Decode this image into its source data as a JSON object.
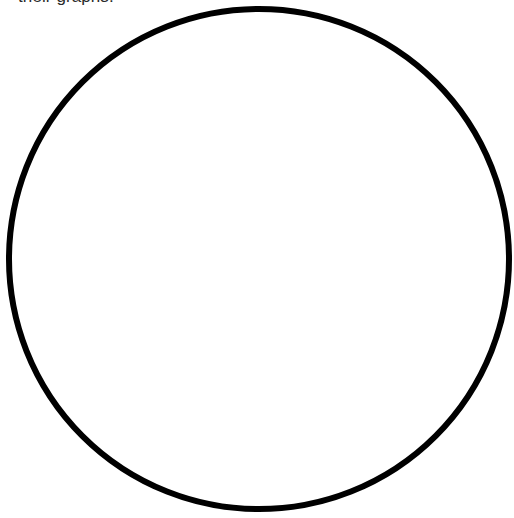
{
  "document": {
    "kind": "worksheet-fragment",
    "background_color": "#ffffff",
    "text_color": "#000000"
  },
  "heading": {
    "clipped_line": "their graphs.",
    "note": "line is cropped by the top edge of the screenshot"
  },
  "chart_data": {
    "type": "pie",
    "title": "",
    "subtitle": "",
    "xlabel": "",
    "ylabel": "",
    "legend_position": "none",
    "grid": false,
    "labels_shown": false,
    "categories": [
      "sector-1",
      "sector-2",
      "sector-3",
      "sector-4",
      "sector-5",
      "sector-6",
      "sector-7",
      "sector-8",
      "sector-9",
      "sector-10"
    ],
    "values": [
      10,
      10,
      10,
      10,
      10,
      10,
      10,
      10,
      10,
      10
    ],
    "slice_count": 10,
    "slice_angle_degrees": 36,
    "slice_fraction": "1/10",
    "all_slices_unfilled": true,
    "slice_fill_color": "#ffffff",
    "outline_color": "#000000",
    "spoke_color": "#111111",
    "geometry": {
      "center_x": 259,
      "center_y": 259,
      "radius": 250,
      "outline_width": 6,
      "spoke_width": 1.4,
      "spoke_angles_degrees": [
        90,
        54,
        18,
        -18,
        -54,
        -90,
        -126,
        -162,
        162,
        126
      ],
      "diameter_count": 5
    }
  }
}
